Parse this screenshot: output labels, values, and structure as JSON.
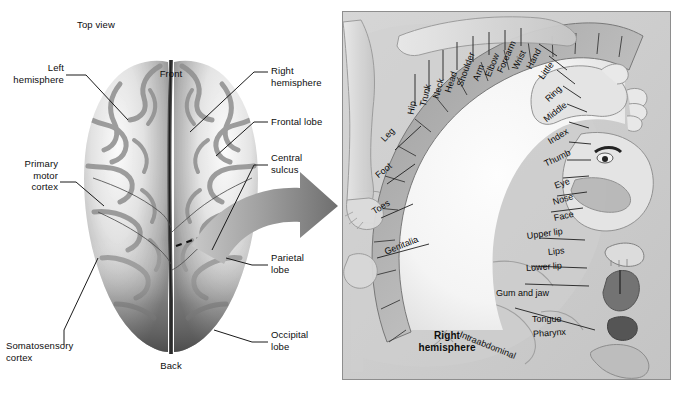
{
  "figure": {
    "title_note": "Top view",
    "domain": "anatomy-diagram",
    "colors": {
      "panel_background": "#cfcfcf",
      "panel_border": "#8e8e8e",
      "cortex_strip": "#b4b4b4",
      "homunculus_body": "#dcdcdc",
      "label_text": "#0d0d0d",
      "leader_line": "#1a1a1a",
      "arrow_fill": "#8c8c8c",
      "brain_light": "#f2f2f2",
      "brain_mid": "#b9b9b9",
      "brain_dark": "#6a6a6a"
    }
  },
  "left_panel": {
    "view_label": "Top view",
    "orientation": {
      "front": "Front",
      "back": "Back"
    },
    "labels": [
      {
        "id": "left-hemisphere",
        "text": "Left\nhemisphere"
      },
      {
        "id": "primary-motor-cortex",
        "text": "Primary\nmotor\ncortex"
      },
      {
        "id": "somatosensory-cortex",
        "text": "Somatosensory\ncortex"
      },
      {
        "id": "right-hemisphere",
        "text": "Right\nhemisphere"
      },
      {
        "id": "frontal-lobe",
        "text": "Frontal lobe"
      },
      {
        "id": "central-sulcus",
        "text": "Central\nsulcus"
      },
      {
        "id": "parietal-lobe",
        "text": "Parietal\nlobe"
      },
      {
        "id": "occipital-lobe",
        "text": "Occipital\nlobe"
      }
    ]
  },
  "right_panel": {
    "caption": "Right\nhemisphere",
    "homunculus_map": {
      "description": "Sensory homunculus — cortical representation sequence along the postcentral gyrus",
      "regions": [
        "Hip",
        "Trunk",
        "Neck",
        "Head",
        "Shoulder",
        "Arm",
        "Elbow",
        "Forearm",
        "Wrist",
        "Hand",
        "Little",
        "Ring",
        "Middle",
        "Index",
        "Thumb",
        "Eye",
        "Nose",
        "Face",
        "Upper lip",
        "Lips",
        "Lower lip",
        "Gum and jaw",
        "Tongue",
        "Pharynx",
        "Intraabdominal"
      ],
      "medial_regions": [
        "Leg",
        "Foot",
        "Toes",
        "Genitalia"
      ],
      "body_illustrations": [
        "homunculus-leg",
        "homunculus-foot",
        "homunculus-arm",
        "homunculus-hand",
        "homunculus-face",
        "jaw-teeth-gums",
        "tongue",
        "pharynx",
        "stomach"
      ]
    }
  }
}
